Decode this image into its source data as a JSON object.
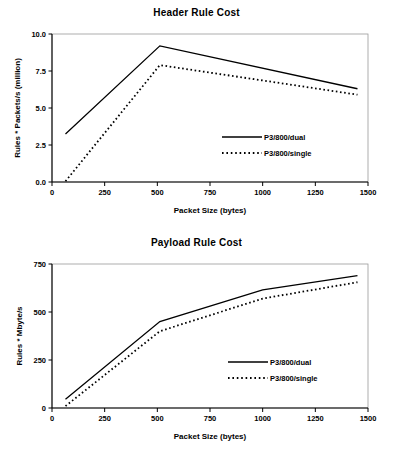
{
  "page": {
    "background_color": "#ffffff",
    "ink_color": "#000000"
  },
  "charts": [
    {
      "id": "header-rule-cost",
      "title": "Header Rule Cost",
      "xlabel": "Packet Size (bytes)",
      "ylabel": "Rules * Packets/s (million)",
      "xticks": [
        "0",
        "250",
        "500",
        "750",
        "1000",
        "1250",
        "1500"
      ],
      "yticks": [
        "0.0",
        "2.5",
        "5.0",
        "7.5",
        "10.0"
      ],
      "legend": [
        {
          "label": "P3/800/dual",
          "style": "solid"
        },
        {
          "label": "P3/800/single",
          "style": "dotted"
        }
      ]
    },
    {
      "id": "payload-rule-cost",
      "title": "Payload Rule Cost",
      "xlabel": "Packet Size (bytes)",
      "ylabel": "Rules * Mbyte/s",
      "xticks": [
        "0",
        "250",
        "500",
        "750",
        "1000",
        "1250",
        "1500"
      ],
      "yticks": [
        "0",
        "250",
        "500",
        "750"
      ],
      "legend": [
        {
          "label": "P3/800/dual",
          "style": "solid"
        },
        {
          "label": "P3/800/single",
          "style": "dotted"
        }
      ]
    }
  ],
  "chart_data": [
    {
      "type": "line",
      "title": "Header Rule Cost",
      "xlabel": "Packet Size (bytes)",
      "ylabel": "Rules * Packets/s (million)",
      "xlim": [
        0,
        1500
      ],
      "ylim": [
        0.0,
        10.0
      ],
      "xticks": [
        0,
        250,
        500,
        750,
        1000,
        1250,
        1500
      ],
      "yticks": [
        0.0,
        2.5,
        5.0,
        7.5,
        10.0
      ],
      "grid": false,
      "legend_position": "center-right",
      "x": [
        64,
        512,
        1450
      ],
      "series": [
        {
          "name": "P3/800/dual",
          "style": "solid",
          "values": [
            3.25,
            9.2,
            6.3
          ]
        },
        {
          "name": "P3/800/single",
          "style": "dotted",
          "values": [
            0.05,
            7.9,
            5.9
          ]
        }
      ]
    },
    {
      "type": "line",
      "title": "Payload Rule Cost",
      "xlabel": "Packet Size (bytes)",
      "ylabel": "Rules * Mbyte/s",
      "xlim": [
        0,
        1500
      ],
      "ylim": [
        0,
        750
      ],
      "xticks": [
        0,
        250,
        500,
        750,
        1000,
        1250,
        1500
      ],
      "yticks": [
        0,
        250,
        500,
        750
      ],
      "grid": false,
      "legend_position": "center-right",
      "x": [
        64,
        512,
        1000,
        1450
      ],
      "series": [
        {
          "name": "P3/800/dual",
          "style": "solid",
          "values": [
            45,
            450,
            615,
            690
          ]
        },
        {
          "name": "P3/800/single",
          "style": "dotted",
          "values": [
            10,
            400,
            570,
            655
          ]
        }
      ]
    }
  ]
}
